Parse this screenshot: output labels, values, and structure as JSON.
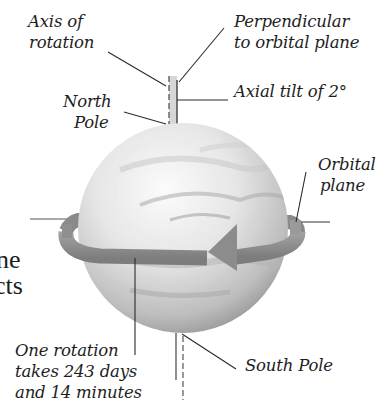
{
  "diagram": {
    "labels": {
      "axis_of_rotation": [
        "Axis of",
        "rotation"
      ],
      "perpendicular": [
        "Perpendicular",
        "to orbital plane"
      ],
      "axial_tilt": "Axial tilt of 2°",
      "north_pole": [
        "North",
        "Pole"
      ],
      "orbital_plane": [
        "Orbital",
        "plane"
      ],
      "one_rotation": [
        "One rotation",
        "takes 243 days",
        "and 14 minutes"
      ],
      "south_pole": "South Pole"
    },
    "clipped_body_text": [
      "ne",
      "cts"
    ],
    "colors": {
      "line": "#2a2a2a",
      "band": "#8f8f8f",
      "band_dark": "#777777",
      "sphere_light": "#f4f4f4",
      "sphere_dark": "#9a9a9a",
      "axis_band": "#d4d4d4"
    }
  }
}
